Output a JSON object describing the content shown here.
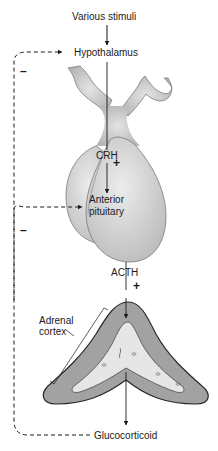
{
  "diagram": {
    "nodes": {
      "stimuli": "Various stimuli",
      "hypothalamus": "Hypothalamus",
      "crh": "CRH",
      "anterior_pituitary_line1": "Anterior",
      "anterior_pituitary_line2": "pituitary",
      "acth": "ACTH",
      "adrenal_cortex_line1": "Adrenal",
      "adrenal_cortex_line2": "cortex",
      "glucocorticoid": "Glucocorticoid"
    },
    "signs": {
      "crh_stimulation": "+",
      "acth_stimulation": "+",
      "feedback_hypothalamus": "–",
      "feedback_pituitary": "–"
    },
    "colors": {
      "line": "#1a1a1a",
      "gland_fill": "#dcdcdc",
      "gland_stroke": "#6a6a6a",
      "cortex_fill": "#9a9a9a",
      "medulla_fill": "#e6e6e6"
    }
  }
}
